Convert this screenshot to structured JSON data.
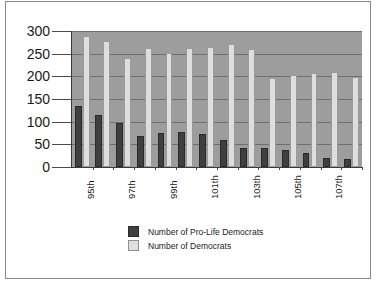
{
  "chart_data": {
    "type": "bar",
    "title": "",
    "subtitle": "",
    "xlabel": "",
    "ylabel": "",
    "ylim": [
      0,
      300
    ],
    "yticks": [
      "0",
      "50",
      "100",
      "150",
      "200",
      "250",
      "300"
    ],
    "grid": true,
    "legend_position": "bottom-center",
    "categories": [
      "95th",
      "96th",
      "97th",
      "98th",
      "99th",
      "100th",
      "101th",
      "102th",
      "103th",
      "104th",
      "105th",
      "106th",
      "107th",
      "108th"
    ],
    "tick_labels_shown": [
      "95th",
      "",
      "97th",
      "",
      "99th",
      "",
      "101th",
      "",
      "103th",
      "",
      "105th",
      "",
      "107th",
      ""
    ],
    "series": [
      {
        "name": "Number of Pro-Life Democrats",
        "color": "#3f3f3f",
        "values": [
          135,
          115,
          98,
          68,
          75,
          77,
          72,
          59,
          41,
          41,
          37,
          31,
          20,
          18
        ]
      },
      {
        "name": "Number of Democrats",
        "color": "#dedede",
        "values": [
          290,
          277,
          240,
          263,
          251,
          263,
          265,
          271,
          260,
          197,
          203,
          208,
          209,
          198
        ]
      }
    ]
  },
  "legend": {
    "items": [
      {
        "label": "Number of Pro-Life Democrats",
        "swatch": "dark"
      },
      {
        "label": "Number of  Democrats",
        "swatch": "light"
      }
    ]
  },
  "colors": {
    "plot_background": "#9d9d9d",
    "page_background": "#ffffff",
    "gridline": "#6e6e6e",
    "frame_border": "#8a8a8a",
    "dark_series": "#3f3f3f",
    "light_series": "#dedede",
    "text": "#1a1a1a"
  }
}
